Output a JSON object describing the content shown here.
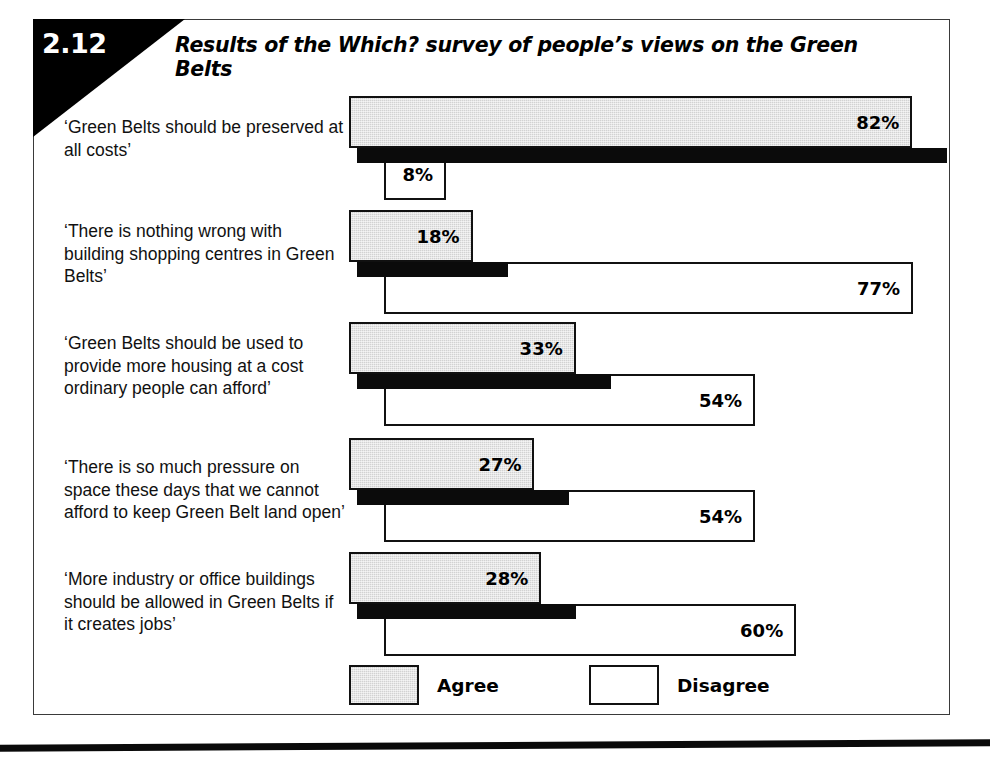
{
  "figure": {
    "number": "2.12",
    "title": "Results of the Which? survey of people’s views on the Green Belts"
  },
  "legend": {
    "agree": {
      "label": "Agree",
      "swatch": "gray-filled-rectangle"
    },
    "disagree": {
      "label": "Disagree",
      "swatch": "white-outlined-rectangle"
    }
  },
  "statements": [
    {
      "text": "‘Green Belts should be preserved at all costs’",
      "agree_label": "82%",
      "disagree_label": "8%"
    },
    {
      "text": "‘There is nothing wrong with building shopping centres in Green Belts’",
      "agree_label": "18%",
      "disagree_label": "77%"
    },
    {
      "text": "‘Green Belts should be used to provide more housing at a cost ordinary people can afford’",
      "agree_label": "33%",
      "disagree_label": "54%"
    },
    {
      "text": "‘There is so much pressure on space these days that we cannot afford to keep Green Belt land open’",
      "agree_label": "27%",
      "disagree_label": "54%"
    },
    {
      "text": "‘More industry or office buildings should be allowed in Green Belts if it creates jobs’",
      "agree_label": "28%",
      "disagree_label": "60%"
    }
  ],
  "colors": {
    "agree_fill": "#d2d2d2",
    "disagree_fill": "#ffffff",
    "outline": "#111111",
    "shadow": "#0b0b0b",
    "header_block": "#000000"
  },
  "chart_data": {
    "type": "bar",
    "title": "Results of the Which? survey of people’s views on the Green Belts",
    "orientation": "horizontal",
    "grouped": true,
    "xlabel": "",
    "ylabel": "",
    "xlim": [
      0,
      100
    ],
    "unit": "percent",
    "grid": false,
    "legend_position": "bottom",
    "axis_visible": false,
    "tick_labels": [],
    "value_labels_shown": true,
    "categories": [
      "‘Green Belts should be preserved at all costs’",
      "‘There is nothing wrong with building shopping centres in Green Belts’",
      "‘Green Belts should be used to provide more housing at a cost ordinary people can afford’",
      "‘There is so much pressure on space these days that we cannot afford to keep Green Belt land open’",
      "‘More industry or office buildings should be allowed in Green Belts if it creates jobs’"
    ],
    "series": [
      {
        "name": "Agree",
        "values": [
          82,
          18,
          33,
          27,
          28
        ]
      },
      {
        "name": "Disagree",
        "values": [
          8,
          77,
          54,
          54,
          60
        ]
      }
    ]
  }
}
